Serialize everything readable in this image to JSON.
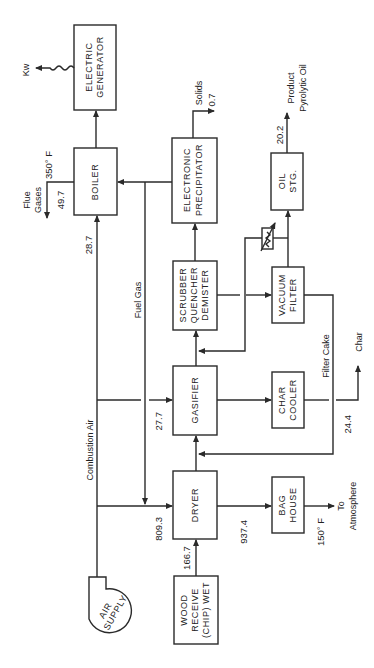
{
  "diagram": {
    "orientation": "rotated-90-ccw",
    "units": {
      "boiler_flue_temp": "350° F",
      "bag_house_temp": "150° F"
    },
    "nodes": {
      "electric_generator": [
        "ELECTRIC",
        "GENERATOR"
      ],
      "boiler": [
        "BOILER"
      ],
      "electronic_precipitator": [
        "ELECTRONIC",
        "PRECIPITATOR"
      ],
      "oil_storage": [
        "OIL",
        "STG."
      ],
      "scrubber": [
        "SCRUBBER",
        "QUENCHER",
        "DEMISTER"
      ],
      "vacuum_filter": [
        "VACUUM",
        "FILTER"
      ],
      "gasifier": [
        "GASIFIER"
      ],
      "char_cooler": [
        "CHAR",
        "COOLER"
      ],
      "dryer": [
        "DRYER"
      ],
      "bag_house": [
        "BAG",
        "HOUSE"
      ],
      "wood_receive": [
        "WOOD",
        "RECEIVE",
        "(CHIP) WET"
      ],
      "air_supply": [
        "AIR",
        "SUPPLY"
      ]
    },
    "stream_labels": {
      "kw": "Kw",
      "flue_gases": [
        "Flue",
        "Gases"
      ],
      "flue_temp": "350° F",
      "flue_value": "49.7",
      "boiler_air": "28.7",
      "fuel_gas": "Fuel Gas",
      "combustion_air": "Combustion Air",
      "gasifier_air": "27.7",
      "dryer_air": "809.3",
      "wood_feed": "166.7",
      "dryer_exhaust": "937.4",
      "bag_house_temp": "150° F",
      "to_atmosphere": [
        "To",
        "Atmosphere"
      ],
      "solids": "Solids",
      "solids_value": "0.7",
      "oil_value": "20.2",
      "product_oil": [
        "Product",
        "Pyrolytic Oil"
      ],
      "filter_cake": "Filter Cake",
      "char_value": "24.4",
      "char": "Char"
    }
  }
}
